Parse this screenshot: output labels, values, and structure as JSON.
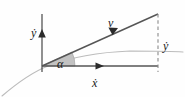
{
  "figure": {
    "type": "vector-diagram",
    "background_color": "#fefefe",
    "line_color": "#4a4a4a",
    "curve_color": "#b9b9b9",
    "wedge_fill": "#bfbfbf",
    "dash_color": "#8a8a8a",
    "text_color": "#1a1a1a"
  },
  "labels": {
    "y_axis": "ẏ",
    "x_axis": "ẋ",
    "velocity": "v",
    "angle": "α",
    "y_component": "ẏ"
  },
  "geometry": {
    "origin": {
      "x": 42,
      "y": 66
    },
    "y_axis_top": {
      "x": 42,
      "y": 14
    },
    "y_axis_bottom": {
      "x": 42,
      "y": 72
    },
    "y_arrow_tip": {
      "x": 42,
      "y": 31
    },
    "x_axis_end": {
      "x": 158,
      "y": 66
    },
    "x_arrow_tip": {
      "x": 100,
      "y": 66
    },
    "vector_end": {
      "x": 158,
      "y": 14
    },
    "vector_arrow_tip": {
      "x": 114,
      "y": 30
    },
    "dashed_line_top": {
      "x": 158,
      "y": 14
    },
    "dashed_line_bottom": {
      "x": 158,
      "y": 72
    },
    "wedge_radius": 30,
    "angle_degrees": 24,
    "curve_start": {
      "x": 2,
      "y": 96
    },
    "curve_end": {
      "x": 183,
      "y": 52
    }
  },
  "label_positions": {
    "y_axis": {
      "x": 31,
      "y": 33
    },
    "x_axis": {
      "x": 96,
      "y": 82
    },
    "velocity": {
      "x": 112,
      "y": 26
    },
    "angle": {
      "x": 62,
      "y": 66
    },
    "y_component": {
      "x": 165,
      "y": 46
    }
  }
}
